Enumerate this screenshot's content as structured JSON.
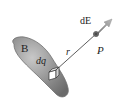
{
  "diagram": {
    "labels": {
      "body": "B",
      "charge_element": "dq",
      "distance": "r",
      "point": "P",
      "field": "dE"
    },
    "colors": {
      "body_fill": "#8a8a8a",
      "body_edge": "#6e6e6e",
      "line": "#333333",
      "arrow": "#9a9a9a",
      "point": "#555555"
    }
  }
}
